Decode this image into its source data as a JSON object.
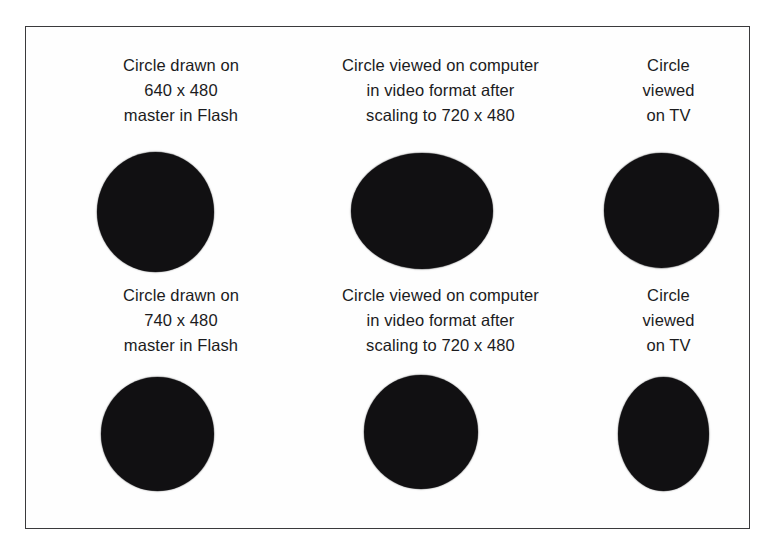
{
  "figure": {
    "background_color": "#ffffff",
    "frame_color": "#3a3a3c",
    "shape_color": "#111012",
    "text_color": "#1b1b1d"
  },
  "rows": [
    {
      "id": "row-1",
      "cells": [
        {
          "id": "r1c1",
          "caption_lines": [
            "Circle drawn on",
            "640 x 480",
            "master in Flash"
          ],
          "shape": "circle"
        },
        {
          "id": "r1c2",
          "caption_lines": [
            "Circle viewed on computer",
            "in video format after",
            "scaling to 720 x 480"
          ],
          "shape": "wide-ellipse"
        },
        {
          "id": "r1c3",
          "caption_lines": [
            "Circle",
            "viewed",
            "on TV"
          ],
          "shape": "circle"
        }
      ]
    },
    {
      "id": "row-2",
      "cells": [
        {
          "id": "r2c1",
          "caption_lines": [
            "Circle drawn on",
            "740 x 480",
            "master in Flash"
          ],
          "shape": "circle"
        },
        {
          "id": "r2c2",
          "caption_lines": [
            "Circle viewed on computer",
            "in video format after",
            "scaling to 720 x 480"
          ],
          "shape": "circle"
        },
        {
          "id": "r2c3",
          "caption_lines": [
            "Circle",
            "viewed",
            "on TV"
          ],
          "shape": "tall-ellipse"
        }
      ]
    }
  ]
}
